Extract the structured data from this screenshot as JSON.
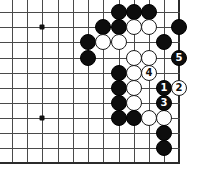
{
  "diagram": {
    "type": "go-board-problem",
    "board_region": "lower-right corner, 12 columns x 11 rows shown",
    "geometry": {
      "cols_x": [
        12,
        27,
        42,
        58,
        73,
        88,
        103,
        119,
        134,
        149,
        164,
        179
      ],
      "rows_y": [
        12,
        27,
        42,
        58,
        73,
        88,
        103,
        118,
        133,
        148,
        163
      ],
      "right_edge_col": 11,
      "bottom_edge_row": 10,
      "stone_diameter": 16
    },
    "star_points": [
      {
        "col": 2,
        "row": 1
      },
      {
        "col": 2,
        "row": 7
      }
    ],
    "stones": [
      {
        "color": "black",
        "col": 7,
        "row": 0,
        "label": ""
      },
      {
        "color": "black",
        "col": 8,
        "row": 0,
        "label": ""
      },
      {
        "color": "black",
        "col": 9,
        "row": 0,
        "label": ""
      },
      {
        "color": "black",
        "col": 6,
        "row": 1,
        "label": ""
      },
      {
        "color": "black",
        "col": 7,
        "row": 1,
        "label": ""
      },
      {
        "color": "white",
        "col": 8,
        "row": 1,
        "label": ""
      },
      {
        "color": "white",
        "col": 9,
        "row": 1,
        "label": ""
      },
      {
        "color": "black",
        "col": 11,
        "row": 1,
        "label": ""
      },
      {
        "color": "black",
        "col": 5,
        "row": 2,
        "label": ""
      },
      {
        "color": "white",
        "col": 6,
        "row": 2,
        "label": ""
      },
      {
        "color": "white",
        "col": 7,
        "row": 2,
        "label": ""
      },
      {
        "color": "black",
        "col": 10,
        "row": 2,
        "label": ""
      },
      {
        "color": "black",
        "col": 5,
        "row": 3,
        "label": ""
      },
      {
        "color": "white",
        "col": 8,
        "row": 3,
        "label": ""
      },
      {
        "color": "white",
        "col": 9,
        "row": 3,
        "label": ""
      },
      {
        "color": "black",
        "col": 11,
        "row": 3,
        "label": "5"
      },
      {
        "color": "black",
        "col": 7,
        "row": 4,
        "label": ""
      },
      {
        "color": "white",
        "col": 8,
        "row": 4,
        "label": ""
      },
      {
        "color": "white",
        "col": 9,
        "row": 4,
        "label": "4"
      },
      {
        "color": "black",
        "col": 7,
        "row": 5,
        "label": ""
      },
      {
        "color": "white",
        "col": 8,
        "row": 5,
        "label": ""
      },
      {
        "color": "black",
        "col": 10,
        "row": 5,
        "label": "1"
      },
      {
        "color": "white",
        "col": 11,
        "row": 5,
        "label": "2"
      },
      {
        "color": "black",
        "col": 7,
        "row": 6,
        "label": ""
      },
      {
        "color": "white",
        "col": 8,
        "row": 6,
        "label": ""
      },
      {
        "color": "black",
        "col": 10,
        "row": 6,
        "label": "3"
      },
      {
        "color": "black",
        "col": 7,
        "row": 7,
        "label": ""
      },
      {
        "color": "black",
        "col": 8,
        "row": 7,
        "label": ""
      },
      {
        "color": "white",
        "col": 9,
        "row": 7,
        "label": ""
      },
      {
        "color": "white",
        "col": 10,
        "row": 7,
        "label": ""
      },
      {
        "color": "black",
        "col": 10,
        "row": 8,
        "label": ""
      },
      {
        "color": "black",
        "col": 10,
        "row": 9,
        "label": ""
      }
    ],
    "colors": {
      "grid_line": "#4a4a4a",
      "edge_line": "#2b2b2b",
      "black_stone": "#0d0d0d",
      "white_stone": "#ffffff",
      "white_stone_border": "#1a1a1a",
      "background": "#ffffff"
    },
    "move_sequence": [
      {
        "number": "1",
        "color": "black"
      },
      {
        "number": "2",
        "color": "white"
      },
      {
        "number": "3",
        "color": "black"
      },
      {
        "number": "4",
        "color": "white"
      },
      {
        "number": "5",
        "color": "black"
      }
    ]
  }
}
